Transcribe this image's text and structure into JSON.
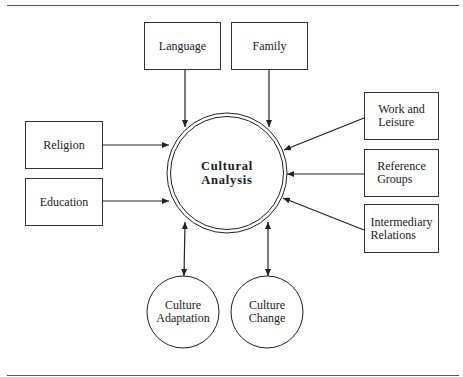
{
  "diagram": {
    "center": {
      "label_line1": "Cultural",
      "label_line2": "Analysis"
    },
    "inputs": {
      "language": "Language",
      "family": "Family",
      "religion": "Religion",
      "education": "Education",
      "work_leisure": {
        "line1": "Work and",
        "line2": "Leisure"
      },
      "reference_groups": {
        "line1": "Reference",
        "line2": "Groups"
      },
      "intermediary_relations": {
        "line1": "Intermediary",
        "line2": "Relations"
      }
    },
    "outputs": {
      "culture_adaptation": {
        "line1": "Culture",
        "line2": "Adaptation"
      },
      "culture_change": {
        "line1": "Culture",
        "line2": "Change"
      }
    },
    "edges": [
      {
        "from": "Language",
        "to": "Cultural Analysis",
        "type": "arrow"
      },
      {
        "from": "Family",
        "to": "Cultural Analysis",
        "type": "arrow"
      },
      {
        "from": "Religion",
        "to": "Cultural Analysis",
        "type": "arrow"
      },
      {
        "from": "Education",
        "to": "Cultural Analysis",
        "type": "arrow"
      },
      {
        "from": "Work and Leisure",
        "to": "Cultural Analysis",
        "type": "arrow"
      },
      {
        "from": "Reference Groups",
        "to": "Cultural Analysis",
        "type": "arrow"
      },
      {
        "from": "Intermediary Relations",
        "to": "Cultural Analysis",
        "type": "arrow"
      },
      {
        "from": "Cultural Analysis",
        "to": "Culture Adaptation",
        "type": "bidirectional"
      },
      {
        "from": "Cultural Analysis",
        "to": "Culture Change",
        "type": "bidirectional"
      }
    ],
    "colors": {
      "line": "#222222",
      "rule": "#555555",
      "background": "#ffffff"
    }
  }
}
